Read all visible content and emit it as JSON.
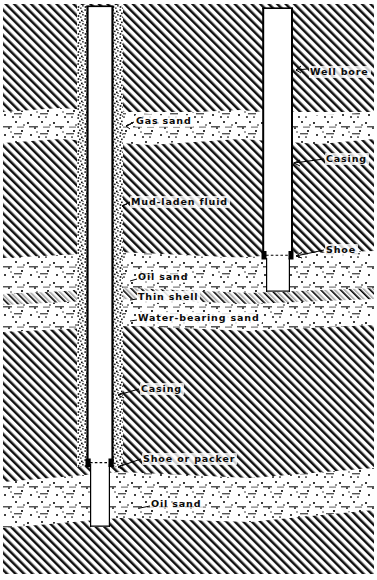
{
  "figure": {
    "type": "geological-well-cross-section",
    "title_visible": false,
    "background_color": "#ffffff",
    "ink_color": "#000000",
    "width": 377,
    "height": 580
  },
  "labels": [
    {
      "id": "well-bore",
      "text": "Well bore",
      "x": 309,
      "y": 72,
      "leader": true
    },
    {
      "id": "gas-sand",
      "text": "Gas sand",
      "x": 136,
      "y": 120,
      "leader": true
    },
    {
      "id": "casing-upper",
      "text": "Casing",
      "x": 326,
      "y": 162,
      "leader": true
    },
    {
      "id": "mud-laden-fluid",
      "text": "Mud-laden fluid",
      "x": 131,
      "y": 201,
      "leader": true
    },
    {
      "id": "shoe",
      "text": "Shoe",
      "x": 326,
      "y": 250,
      "leader": true
    },
    {
      "id": "oil-sand-upper",
      "text": "Oil sand",
      "x": 138,
      "y": 276,
      "leader": false
    },
    {
      "id": "thin-shell",
      "text": "Thin shell",
      "x": 138,
      "y": 296,
      "leader": false
    },
    {
      "id": "water-bearing-sand",
      "text": "Water-bearing sand",
      "x": 138,
      "y": 317,
      "leader": false
    },
    {
      "id": "casing-lower",
      "text": "Casing",
      "x": 141,
      "y": 388,
      "leader": true
    },
    {
      "id": "shoe-or-packer",
      "text": "Shoe or packer",
      "x": 143,
      "y": 458,
      "leader": true
    },
    {
      "id": "oil-sand-lower",
      "text": "Oil sand",
      "x": 151,
      "y": 503,
      "leader": false
    }
  ],
  "strata": [
    {
      "id": "overburden-upper",
      "name": "shale (diagonal hatch)",
      "top": 0,
      "bottom": 110,
      "fill": "hatch"
    },
    {
      "id": "gas-sand-bed",
      "name": "Gas sand",
      "top": 108,
      "bottom": 142,
      "fill": "sand"
    },
    {
      "id": "shale-middle",
      "name": "shale (diagonal hatch)",
      "top": 142,
      "bottom": 258,
      "fill": "hatch"
    },
    {
      "id": "oil-sand-bed",
      "name": "Oil sand",
      "top": 256,
      "bottom": 293,
      "fill": "sand"
    },
    {
      "id": "thin-shell-bed",
      "name": "Thin shell",
      "top": 292,
      "bottom": 304,
      "fill": "shell"
    },
    {
      "id": "water-sand-bed",
      "name": "Water-bearing sand",
      "top": 303,
      "bottom": 331,
      "fill": "sand"
    },
    {
      "id": "shale-lower",
      "name": "shale (diagonal hatch)",
      "top": 330,
      "bottom": 474,
      "fill": "hatch"
    },
    {
      "id": "oil-sand-bed-2",
      "name": "Oil sand",
      "top": 472,
      "bottom": 529,
      "fill": "sand"
    },
    {
      "id": "shale-bottom",
      "name": "shale (diagonal hatch)",
      "top": 528,
      "bottom": 574,
      "fill": "hatch"
    }
  ],
  "wells": [
    {
      "id": "left-well",
      "name": "cased and cemented well with shoe or packer",
      "bore_left": 88,
      "bore_right": 112,
      "casing_top": 6,
      "shoe_y": 463,
      "bore_bottom": 527,
      "annulus_left": 77,
      "annulus_right": 123,
      "open_hole_left": 90,
      "open_hole_right": 110
    },
    {
      "id": "right-well",
      "name": "cased well with shoe, open hole below",
      "bore_left": 263,
      "bore_right": 293,
      "casing_top": 8,
      "shoe_y": 256,
      "bore_bottom": 290,
      "open_hole_left": 266,
      "open_hole_right": 290
    }
  ]
}
